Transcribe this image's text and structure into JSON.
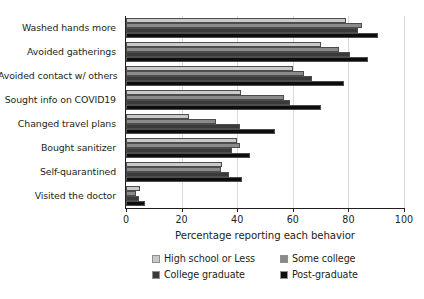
{
  "chart_data": {
    "type": "bar",
    "orientation": "horizontal",
    "grouped": true,
    "title": "",
    "xlabel": "Percentage reporting each behavior",
    "ylabel": "",
    "xlim": [
      0,
      100
    ],
    "xticks": [
      0,
      20,
      40,
      60,
      80,
      100
    ],
    "xtick_labels": [
      "0",
      "20",
      "40",
      "60",
      "80",
      "100"
    ],
    "grid": "vertical",
    "legend_position": "bottom",
    "categories": [
      "Washed hands more",
      "Avoided gatherings",
      "Avoided contact w/ others",
      "Sought info on COVID19",
      "Changed travel plans",
      "Bought sanitizer",
      "Self-quarantined",
      "Visited the doctor"
    ],
    "series": [
      {
        "name": "High school or Less",
        "color": "#c9c9c9",
        "values": [
          79,
          70,
          60,
          41.5,
          22.5,
          40,
          34.5,
          5
        ]
      },
      {
        "name": "Some college",
        "color": "#8a8a8a",
        "values": [
          85,
          76.5,
          64,
          57,
          32.5,
          41,
          34,
          3.5
        ]
      },
      {
        "name": "College graduate",
        "color": "#3a3a3a",
        "values": [
          83.5,
          80.5,
          67,
          59,
          41,
          38,
          37,
          4.7
        ]
      },
      {
        "name": "Post-graduate",
        "color": "#0d0d0d",
        "values": [
          90.5,
          87,
          78.5,
          70,
          53.5,
          44.5,
          41.7,
          7
        ]
      }
    ]
  },
  "legend": {
    "items": [
      {
        "label": "High school or Less",
        "swatch": "s0"
      },
      {
        "label": "Some college",
        "swatch": "s1"
      },
      {
        "label": "College graduate",
        "swatch": "s2"
      },
      {
        "label": "Post-graduate",
        "swatch": "s3"
      }
    ]
  }
}
